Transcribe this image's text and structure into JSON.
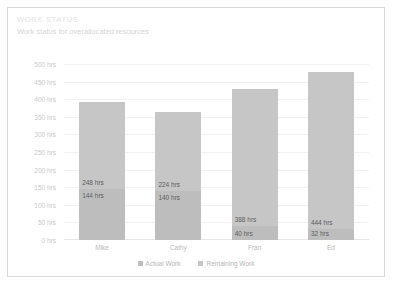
{
  "card": {
    "title": "WORK STATUS",
    "subtitle": "Work status for overallocated resources",
    "border_color": "#d8d8d8",
    "background": "#ffffff"
  },
  "chart_data": {
    "type": "bar",
    "stacked": true,
    "title": "WORK STATUS",
    "subtitle": "Work status for overallocated resources",
    "xlabel": "",
    "ylabel": "",
    "ylim": [
      0,
      500
    ],
    "grid": true,
    "legend_position": "bottom",
    "categories": [
      "Mike",
      "Cathy",
      "Fran",
      "Ed"
    ],
    "ytick_labels": [
      "500 hrs",
      "450 hrs",
      "400 hrs",
      "350 hrs",
      "300 hrs",
      "250 hrs",
      "200 hrs",
      "150 hrs",
      "100 hrs",
      "50 hrs",
      "0 hrs"
    ],
    "ytick_values": [
      500,
      450,
      400,
      350,
      300,
      250,
      200,
      150,
      100,
      50,
      0
    ],
    "series": [
      {
        "name": "Actual Work",
        "color": "#bdbdbd",
        "values": [
          144,
          140,
          40,
          32
        ],
        "labels": [
          "144 hrs",
          "140 hrs",
          "40 hrs",
          "32 hrs"
        ]
      },
      {
        "name": "Remaining Work",
        "color": "#c6c6c6",
        "values": [
          248,
          224,
          388,
          444
        ],
        "labels": [
          "248 hrs",
          "224 hrs",
          "388 hrs",
          "444 hrs"
        ]
      }
    ],
    "totals": [
      392,
      364,
      428,
      476
    ]
  },
  "legend": {
    "items": [
      {
        "label": "Actual Work",
        "color": "#bdbdbd"
      },
      {
        "label": "Remaining Work",
        "color": "#c6c6c6"
      }
    ]
  }
}
